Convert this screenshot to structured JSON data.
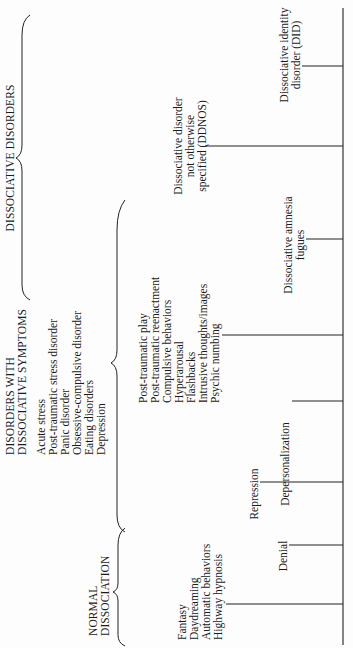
{
  "diagram": {
    "orientation": "rotated-90-ccw",
    "sections": [
      {
        "id": "dissociative-disorders",
        "heading": [
          "DISSOCIATIVE DISORDERS"
        ]
      },
      {
        "id": "disorders-with-dissociative-symptoms",
        "heading": [
          "DISORDERS WITH",
          "DISSOCIATIVE SYMPTOMS"
        ],
        "items": [
          "Acute stress",
          "Post-traumatic stress disorder",
          "Panic disorder",
          "Obsessive-compulsive disorder",
          "Eating disorders",
          "Depression"
        ]
      },
      {
        "id": "normal-dissociation",
        "heading": [
          "NORMAL",
          "DISSOCIATION"
        ]
      }
    ],
    "continuum": [
      {
        "id": "normal",
        "lines": [
          "Fantasy",
          "Daydreaming",
          "Automatic behaviors",
          "Highway hypnosis"
        ]
      },
      {
        "id": "denial",
        "lines": [
          "Denial"
        ]
      },
      {
        "id": "repression",
        "lines": [
          "Repression"
        ]
      },
      {
        "id": "depersonalization",
        "lines": [
          "Depersonalization"
        ]
      },
      {
        "id": "ptsd-symptoms",
        "lines": [
          "Post-traumatic play",
          "Post-traumatic reenactment",
          "Compulsive behaviors",
          "Hyperarousal",
          "Flashbacks",
          "Intrusive thoughts/images",
          "Psychic numbing"
        ]
      },
      {
        "id": "amnesia",
        "lines": [
          "Dissociative amnesia",
          "fugues"
        ]
      },
      {
        "id": "ddnos",
        "lines": [
          "Dissociative disorder",
          "not otherwise",
          "specified (DDNOS)"
        ]
      },
      {
        "id": "did",
        "lines": [
          "Dissociative identity",
          "disorder (DID)"
        ]
      }
    ]
  }
}
